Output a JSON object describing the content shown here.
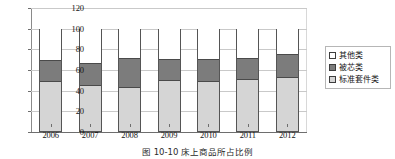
{
  "chart_data": {
    "type": "bar",
    "title": "",
    "subtitle": "",
    "xlabel": "",
    "ylabel": "",
    "stacked": true,
    "grid": true,
    "legend_position": "right",
    "ylim": [
      0,
      120
    ],
    "yticks": [
      0,
      20,
      40,
      60,
      80,
      100,
      120
    ],
    "ytick_labels": [
      "0",
      "20",
      "40",
      "60",
      "80",
      "100",
      "120"
    ],
    "categories": [
      "2006",
      "2007",
      "2008",
      "2009",
      "2010",
      "2011",
      "2012"
    ],
    "series": [
      {
        "name": "标准套件类",
        "color": "#d5d5d5",
        "values": [
          47,
          44,
          42,
          48,
          47,
          49,
          51
        ]
      },
      {
        "name": "被芯类",
        "color": "#7c7c7c",
        "values": [
          22,
          22,
          29,
          22,
          23,
          22,
          24
        ]
      },
      {
        "name": "其他类",
        "color": "#ffffff",
        "values": [
          31,
          34,
          29,
          30,
          30,
          29,
          25
        ]
      }
    ],
    "cumulative_tops": [
      {
        "category": "2006",
        "std": 47,
        "std_plus_core": 69,
        "total": 100
      },
      {
        "category": "2007",
        "std": 44,
        "std_plus_core": 66,
        "total": 100
      },
      {
        "category": "2008",
        "std": 42,
        "std_plus_core": 71,
        "total": 100
      },
      {
        "category": "2009",
        "std": 48,
        "std_plus_core": 70,
        "total": 100
      },
      {
        "category": "2010",
        "std": 47,
        "std_plus_core": 70,
        "total": 100
      },
      {
        "category": "2011",
        "std": 49,
        "std_plus_core": 71,
        "total": 100
      },
      {
        "category": "2012",
        "std": 51,
        "std_plus_core": 75,
        "total": 100
      }
    ]
  },
  "legend": {
    "items": [
      {
        "label": "其他类",
        "swatch": "other"
      },
      {
        "label": "被芯类",
        "swatch": "core"
      },
      {
        "label": "标准套件类",
        "swatch": "std"
      }
    ]
  },
  "caption": {
    "text": "图 10-10  床上商品所占比例"
  },
  "colors": {
    "segment_other": "#ffffff",
    "segment_core": "#7c7c7c",
    "segment_std": "#d5d5d5",
    "bar_outline": "#555555",
    "gridline": "#c9c9c9",
    "axis": "#6e6e6e",
    "text": "#141414"
  }
}
